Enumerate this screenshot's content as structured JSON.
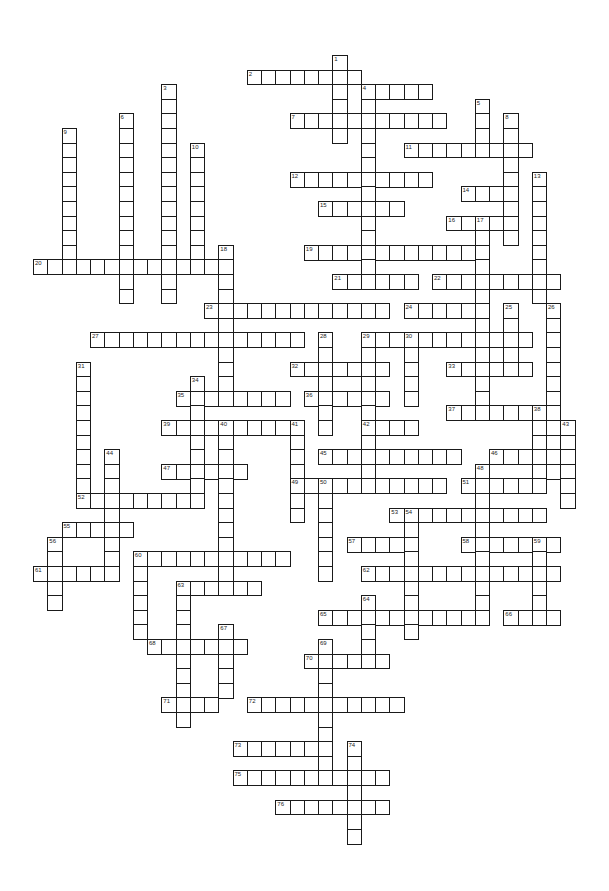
{
  "puzzle": {
    "type": "crossword",
    "grid": {
      "origin_x": 33,
      "origin_y": 55,
      "cell_w": 14.25,
      "cell_h": 14.6,
      "border_color": "#1a1a1a",
      "fill_color": "#ffffff"
    },
    "entries": [
      {
        "num": 1,
        "dir": "down",
        "row": 0,
        "col": 21,
        "len": 6
      },
      {
        "num": 2,
        "dir": "across",
        "row": 1,
        "col": 15,
        "len": 8
      },
      {
        "num": 3,
        "dir": "down",
        "row": 2,
        "col": 9,
        "len": 15
      },
      {
        "num": 4,
        "dir": "across",
        "row": 2,
        "col": 23,
        "len": 5
      },
      {
        "num": 4,
        "dir": "down",
        "row": 2,
        "col": 23,
        "len": 14
      },
      {
        "num": 5,
        "dir": "down",
        "row": 3,
        "col": 31,
        "len": 4
      },
      {
        "num": 6,
        "dir": "down",
        "row": 4,
        "col": 6,
        "len": 13
      },
      {
        "num": 7,
        "dir": "across",
        "row": 4,
        "col": 18,
        "len": 11
      },
      {
        "num": 8,
        "dir": "down",
        "row": 4,
        "col": 33,
        "len": 9
      },
      {
        "num": 9,
        "dir": "down",
        "row": 5,
        "col": 2,
        "len": 10
      },
      {
        "num": 10,
        "dir": "down",
        "row": 6,
        "col": 11,
        "len": 9
      },
      {
        "num": 11,
        "dir": "across",
        "row": 6,
        "col": 26,
        "len": 9
      },
      {
        "num": 12,
        "dir": "across",
        "row": 8,
        "col": 18,
        "len": 10
      },
      {
        "num": 13,
        "dir": "down",
        "row": 8,
        "col": 35,
        "len": 9
      },
      {
        "num": 14,
        "dir": "across",
        "row": 9,
        "col": 30,
        "len": 4
      },
      {
        "num": 15,
        "dir": "across",
        "row": 10,
        "col": 20,
        "len": 6
      },
      {
        "num": 16,
        "dir": "across",
        "row": 11,
        "col": 29,
        "len": 5
      },
      {
        "num": 17,
        "dir": "down",
        "row": 11,
        "col": 31,
        "len": 14
      },
      {
        "num": 18,
        "dir": "down",
        "row": 13,
        "col": 13,
        "len": 11
      },
      {
        "num": 19,
        "dir": "across",
        "row": 13,
        "col": 19,
        "len": 13
      },
      {
        "num": 20,
        "dir": "across",
        "row": 14,
        "col": 0,
        "len": 14
      },
      {
        "num": 21,
        "dir": "across",
        "row": 15,
        "col": 21,
        "len": 6
      },
      {
        "num": 22,
        "dir": "across",
        "row": 15,
        "col": 28,
        "len": 9
      },
      {
        "num": 23,
        "dir": "across",
        "row": 17,
        "col": 12,
        "len": 13
      },
      {
        "num": 24,
        "dir": "across",
        "row": 17,
        "col": 26,
        "len": 6
      },
      {
        "num": 25,
        "dir": "down",
        "row": 17,
        "col": 33,
        "len": 5
      },
      {
        "num": 26,
        "dir": "down",
        "row": 17,
        "col": 36,
        "len": 12
      },
      {
        "num": 27,
        "dir": "across",
        "row": 19,
        "col": 4,
        "len": 15
      },
      {
        "num": 28,
        "dir": "down",
        "row": 19,
        "col": 20,
        "len": 7
      },
      {
        "num": 29,
        "dir": "across",
        "row": 19,
        "col": 23,
        "len": 12
      },
      {
        "num": 29,
        "dir": "down",
        "row": 19,
        "col": 23,
        "len": 11
      },
      {
        "num": 30,
        "dir": "down",
        "row": 19,
        "col": 26,
        "len": 5
      },
      {
        "num": 31,
        "dir": "down",
        "row": 21,
        "col": 3,
        "len": 10
      },
      {
        "num": 32,
        "dir": "across",
        "row": 21,
        "col": 18,
        "len": 7
      },
      {
        "num": 33,
        "dir": "across",
        "row": 21,
        "col": 29,
        "len": 6
      },
      {
        "num": 34,
        "dir": "down",
        "row": 22,
        "col": 11,
        "len": 9
      },
      {
        "num": 35,
        "dir": "across",
        "row": 23,
        "col": 10,
        "len": 8
      },
      {
        "num": 36,
        "dir": "across",
        "row": 23,
        "col": 19,
        "len": 6
      },
      {
        "num": 37,
        "dir": "across",
        "row": 24,
        "col": 29,
        "len": 8
      },
      {
        "num": 38,
        "dir": "down",
        "row": 24,
        "col": 35,
        "len": 6
      },
      {
        "num": 39,
        "dir": "across",
        "row": 25,
        "col": 9,
        "len": 10
      },
      {
        "num": 40,
        "dir": "down",
        "row": 25,
        "col": 13,
        "len": 12
      },
      {
        "num": 41,
        "dir": "down",
        "row": 25,
        "col": 18,
        "len": 7
      },
      {
        "num": 42,
        "dir": "across",
        "row": 25,
        "col": 23,
        "len": 4
      },
      {
        "num": 43,
        "dir": "down",
        "row": 25,
        "col": 37,
        "len": 6
      },
      {
        "num": 44,
        "dir": "down",
        "row": 27,
        "col": 5,
        "len": 9
      },
      {
        "num": 45,
        "dir": "across",
        "row": 27,
        "col": 20,
        "len": 10
      },
      {
        "num": 46,
        "dir": "across",
        "row": 27,
        "col": 32,
        "len": 6
      },
      {
        "num": 47,
        "dir": "across",
        "row": 28,
        "col": 9,
        "len": 6
      },
      {
        "num": 48,
        "dir": "down",
        "row": 28,
        "col": 31,
        "len": 11
      },
      {
        "num": 49,
        "dir": "across",
        "row": 29,
        "col": 18,
        "len": 11
      },
      {
        "num": 50,
        "dir": "down",
        "row": 29,
        "col": 20,
        "len": 7
      },
      {
        "num": 51,
        "dir": "across",
        "row": 29,
        "col": 30,
        "len": 6
      },
      {
        "num": 52,
        "dir": "across",
        "row": 30,
        "col": 3,
        "len": 9
      },
      {
        "num": 53,
        "dir": "across",
        "row": 31,
        "col": 25,
        "len": 11
      },
      {
        "num": 54,
        "dir": "down",
        "row": 31,
        "col": 26,
        "len": 9
      },
      {
        "num": 55,
        "dir": "across",
        "row": 32,
        "col": 2,
        "len": 5
      },
      {
        "num": 56,
        "dir": "down",
        "row": 33,
        "col": 1,
        "len": 5
      },
      {
        "num": 57,
        "dir": "across",
        "row": 33,
        "col": 22,
        "len": 5
      },
      {
        "num": 58,
        "dir": "across",
        "row": 33,
        "col": 30,
        "len": 7
      },
      {
        "num": 59,
        "dir": "down",
        "row": 33,
        "col": 35,
        "len": 6
      },
      {
        "num": 60,
        "dir": "across",
        "row": 34,
        "col": 7,
        "len": 11
      },
      {
        "num": 60,
        "dir": "down",
        "row": 34,
        "col": 7,
        "len": 6
      },
      {
        "num": 61,
        "dir": "across",
        "row": 35,
        "col": 0,
        "len": 6
      },
      {
        "num": 62,
        "dir": "across",
        "row": 35,
        "col": 23,
        "len": 14
      },
      {
        "num": 63,
        "dir": "across",
        "row": 36,
        "col": 10,
        "len": 6
      },
      {
        "num": 63,
        "dir": "down",
        "row": 36,
        "col": 10,
        "len": 10
      },
      {
        "num": 64,
        "dir": "down",
        "row": 37,
        "col": 23,
        "len": 5
      },
      {
        "num": 65,
        "dir": "across",
        "row": 38,
        "col": 20,
        "len": 12
      },
      {
        "num": 66,
        "dir": "across",
        "row": 38,
        "col": 33,
        "len": 4
      },
      {
        "num": 67,
        "dir": "down",
        "row": 39,
        "col": 13,
        "len": 5
      },
      {
        "num": 68,
        "dir": "across",
        "row": 40,
        "col": 8,
        "len": 7
      },
      {
        "num": 69,
        "dir": "down",
        "row": 40,
        "col": 20,
        "len": 10
      },
      {
        "num": 70,
        "dir": "across",
        "row": 41,
        "col": 19,
        "len": 6
      },
      {
        "num": 71,
        "dir": "across",
        "row": 44,
        "col": 9,
        "len": 4
      },
      {
        "num": 72,
        "dir": "across",
        "row": 44,
        "col": 15,
        "len": 11
      },
      {
        "num": 73,
        "dir": "across",
        "row": 47,
        "col": 14,
        "len": 7
      },
      {
        "num": 74,
        "dir": "down",
        "row": 47,
        "col": 22,
        "len": 7
      },
      {
        "num": 75,
        "dir": "across",
        "row": 49,
        "col": 14,
        "len": 11
      },
      {
        "num": 76,
        "dir": "across",
        "row": 51,
        "col": 17,
        "len": 8
      }
    ]
  }
}
